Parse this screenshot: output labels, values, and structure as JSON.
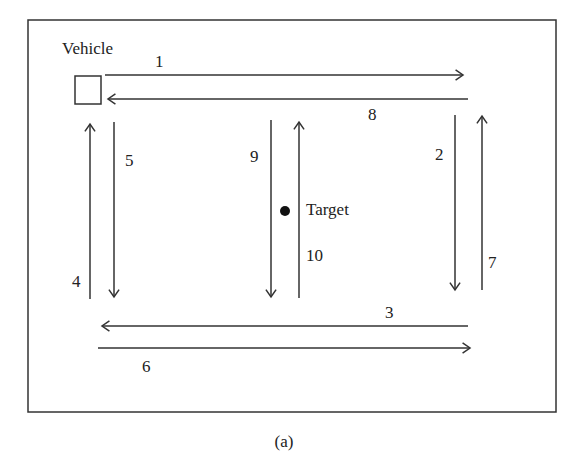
{
  "diagram": {
    "frame": {
      "x": 28,
      "y": 20,
      "width": 528,
      "height": 392
    },
    "vehicle": {
      "label": "Vehicle",
      "label_pos": [
        62,
        54
      ],
      "box": {
        "x": 75,
        "y": 76,
        "width": 26,
        "height": 28
      }
    },
    "target": {
      "label": "Target",
      "label_pos": [
        306,
        215
      ],
      "dot": [
        285,
        211
      ],
      "radius": 5
    },
    "caption": "(a)",
    "arrows": [
      {
        "id": "1",
        "label": "1",
        "from": [
          105,
          75
        ],
        "to": [
          463,
          75
        ],
        "label_pos": [
          155,
          67
        ]
      },
      {
        "id": "2",
        "label": "2",
        "from": [
          455,
          115
        ],
        "to": [
          455,
          290
        ],
        "label_pos": [
          435,
          160
        ]
      },
      {
        "id": "3",
        "label": "3",
        "from": [
          468,
          326
        ],
        "to": [
          102,
          326
        ],
        "label_pos": [
          385,
          318
        ]
      },
      {
        "id": "4",
        "label": "4",
        "from": [
          90,
          299
        ],
        "to": [
          90,
          124
        ],
        "label_pos": [
          72,
          287
        ]
      },
      {
        "id": "5",
        "label": "5",
        "from": [
          114,
          122
        ],
        "to": [
          114,
          297
        ],
        "label_pos": [
          125,
          166
        ]
      },
      {
        "id": "6",
        "label": "6",
        "from": [
          98,
          348
        ],
        "to": [
          470,
          348
        ],
        "label_pos": [
          142,
          372
        ]
      },
      {
        "id": "7",
        "label": "7",
        "from": [
          482,
          290
        ],
        "to": [
          482,
          116
        ],
        "label_pos": [
          488,
          268
        ]
      },
      {
        "id": "8",
        "label": "8",
        "from": [
          468,
          99
        ],
        "to": [
          108,
          99
        ],
        "label_pos": [
          368,
          120
        ]
      },
      {
        "id": "9",
        "label": "9",
        "from": [
          271,
          120
        ],
        "to": [
          271,
          297
        ],
        "label_pos": [
          250,
          162
        ]
      },
      {
        "id": "10",
        "label": "10",
        "from": [
          299,
          298
        ],
        "to": [
          299,
          122
        ],
        "label_pos": [
          306,
          261
        ]
      }
    ]
  }
}
